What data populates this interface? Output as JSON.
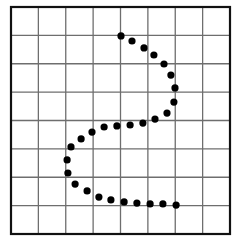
{
  "figure": {
    "grid": {
      "columns": 8,
      "rows": 8
    },
    "colors": {
      "background": "#ffffff",
      "border": "#111111",
      "grid_lines": "#6e6e6e",
      "dots": "#000000"
    },
    "dots_unit": "grid cells from top-left corner [column, row]",
    "dots": [
      [
        4.02,
        1.02
      ],
      [
        4.42,
        1.2
      ],
      [
        4.86,
        1.44
      ],
      [
        5.22,
        1.69
      ],
      [
        5.59,
        2.01
      ],
      [
        5.84,
        2.4
      ],
      [
        5.99,
        2.85
      ],
      [
        5.95,
        3.35
      ],
      [
        5.7,
        3.74
      ],
      [
        5.26,
        3.95
      ],
      [
        4.82,
        4.09
      ],
      [
        4.35,
        4.16
      ],
      [
        3.87,
        4.19
      ],
      [
        3.4,
        4.23
      ],
      [
        2.96,
        4.41
      ],
      [
        2.56,
        4.65
      ],
      [
        2.19,
        4.93
      ],
      [
        2.05,
        5.39
      ],
      [
        2.08,
        5.85
      ],
      [
        2.34,
        6.24
      ],
      [
        2.78,
        6.48
      ],
      [
        3.21,
        6.7
      ],
      [
        3.65,
        6.8
      ],
      [
        4.13,
        6.87
      ],
      [
        4.6,
        6.91
      ],
      [
        5.08,
        6.94
      ],
      [
        5.55,
        6.94
      ],
      [
        6.03,
        6.98
      ]
    ]
  }
}
